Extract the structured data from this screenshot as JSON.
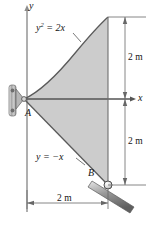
{
  "figure": {
    "axes": {
      "x_label": "x",
      "y_label": "y"
    },
    "curves": [
      {
        "name": "parabola",
        "equation_base": "y",
        "equation_exp": "2",
        "equation_rest": " = 2x"
      },
      {
        "name": "line",
        "equation": "y = −x"
      }
    ],
    "points": [
      {
        "name": "A",
        "label": "A",
        "support": "pin"
      },
      {
        "name": "B",
        "label": "B",
        "support": "roller-on-incline"
      }
    ],
    "dimensions": [
      {
        "name": "upper-vertical",
        "label": "2 m",
        "orientation": "vertical"
      },
      {
        "name": "lower-vertical",
        "label": "2 m",
        "orientation": "vertical"
      },
      {
        "name": "horizontal",
        "label": "2 m",
        "orientation": "horizontal"
      }
    ],
    "colors": {
      "region_fill": "#cccccc",
      "outline": "#555555",
      "axis": "#808080",
      "support_metal": "#999999",
      "text": "#141414"
    }
  }
}
